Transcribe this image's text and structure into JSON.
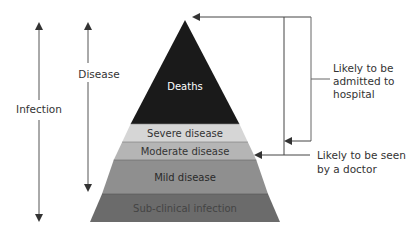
{
  "diagram": {
    "type": "pyramid",
    "layers": [
      {
        "label": "Deaths",
        "color": "#1a1a1a",
        "text_color": "#ffffff"
      },
      {
        "label": "Severe disease",
        "color": "#d6d6d6",
        "text_color": "#333333"
      },
      {
        "label": "Moderate disease",
        "color": "#b5b5b5",
        "text_color": "#333333"
      },
      {
        "label": "Mild disease",
        "color": "#8f8f8f",
        "text_color": "#2a2a2a"
      },
      {
        "label": "Sub-clinical infection",
        "color": "#6b6b6b",
        "text_color": "#444444"
      }
    ],
    "left_arrows": {
      "infection": "Infection",
      "disease": "Disease"
    },
    "right_annotations": {
      "hospital": [
        "Likely to be",
        "admitted to",
        "hospital"
      ],
      "doctor": [
        "Likely to be seen",
        "by a doctor"
      ]
    },
    "line_color": "#444444"
  }
}
